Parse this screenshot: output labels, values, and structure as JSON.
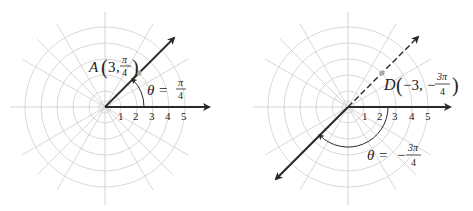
{
  "panels": [
    {
      "id": "left",
      "point_label": "A",
      "point_r": "3",
      "point_theta_num": "π",
      "point_theta_den": "4",
      "theta_label": "θ =",
      "theta_num": "π",
      "theta_den": "4",
      "ticks": [
        "1",
        "2",
        "3",
        "4",
        "5"
      ]
    },
    {
      "id": "right",
      "point_label": "D",
      "point_r": "−3,",
      "point_theta_prefix": "−",
      "point_theta_num": "3π",
      "point_theta_den": "4",
      "theta_label": "θ =",
      "theta_prefix": "−",
      "theta_num": "3π",
      "theta_den": "4",
      "ticks": [
        "1",
        "2",
        "3",
        "4",
        "5"
      ]
    }
  ],
  "colors": {
    "grid": "#d4d4d4",
    "ray": "#2a2a2a",
    "point": "#aaaaaa"
  }
}
